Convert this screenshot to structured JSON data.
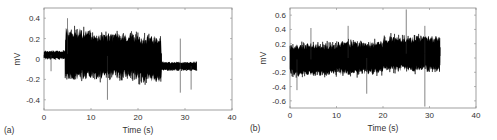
{
  "chart_data": [
    {
      "type": "line",
      "panel_label": "(a)",
      "title": "",
      "xlabel": "Time (s)",
      "ylabel": "mV",
      "xlim": [
        0,
        40
      ],
      "ylim": [
        -0.5,
        0.5
      ],
      "xticks": [
        0,
        10,
        20,
        30,
        40
      ],
      "yticks": [
        -0.4,
        -0.2,
        0,
        0.2,
        0.4
      ],
      "ytick_labels": [
        "-0.4",
        "-0.2",
        "0",
        "0.2",
        "0.4"
      ],
      "grid": false,
      "frame": {
        "x0": 44,
        "y0": 8,
        "x1": 232,
        "y1": 110
      },
      "signal_end": 32.5,
      "envelope": [
        {
          "t0": 0,
          "t1": 4.5,
          "center": 0.04,
          "amp": 0.05
        },
        {
          "t0": 4.5,
          "t1": 10,
          "center": 0.05,
          "amp": 0.3
        },
        {
          "t0": 10,
          "t1": 20,
          "center": 0.03,
          "amp": 0.27
        },
        {
          "t0": 20,
          "t1": 25,
          "center": 0.0,
          "amp": 0.27
        },
        {
          "t0": 25,
          "t1": 32.5,
          "center": -0.07,
          "amp": 0.05
        }
      ],
      "spikes": [
        {
          "t": 1.5,
          "v": -0.12
        },
        {
          "t": 13.5,
          "v": -0.4
        },
        {
          "t": 29,
          "v": 0.2
        },
        {
          "t": 29,
          "v": -0.33
        },
        {
          "t": 31.3,
          "v": -0.3
        },
        {
          "t": 5,
          "v": 0.4
        }
      ]
    },
    {
      "type": "line",
      "panel_label": "(b)",
      "title": "",
      "xlabel": "Time (s)",
      "ylabel": "mV",
      "xlim": [
        0,
        40
      ],
      "ylim": [
        -0.7,
        0.7
      ],
      "xticks": [
        0,
        10,
        20,
        30,
        40
      ],
      "yticks": [
        -0.6,
        -0.4,
        -0.2,
        0,
        0.2,
        0.4,
        0.6
      ],
      "ytick_labels": [
        "-0.6",
        "-0.4",
        "-0.2",
        "0",
        "0.2",
        "0.4",
        "0.6"
      ],
      "grid": false,
      "frame": {
        "x0": 290,
        "y0": 8,
        "x1": 476,
        "y1": 108
      },
      "signal_end": 32.3,
      "envelope": [
        {
          "t0": 0,
          "t1": 10,
          "center": -0.02,
          "amp": 0.27
        },
        {
          "t0": 10,
          "t1": 20,
          "center": 0.0,
          "amp": 0.28
        },
        {
          "t0": 20,
          "t1": 32.3,
          "center": 0.06,
          "amp": 0.3
        }
      ],
      "spikes": [
        {
          "t": 25,
          "v": 0.68
        },
        {
          "t": 29,
          "v": -0.68
        },
        {
          "t": 29,
          "v": 0.45
        },
        {
          "t": 16.5,
          "v": -0.5
        },
        {
          "t": 1.5,
          "v": -0.45
        },
        {
          "t": 4.5,
          "v": 0.42
        },
        {
          "t": 12.5,
          "v": 0.45
        }
      ]
    }
  ]
}
